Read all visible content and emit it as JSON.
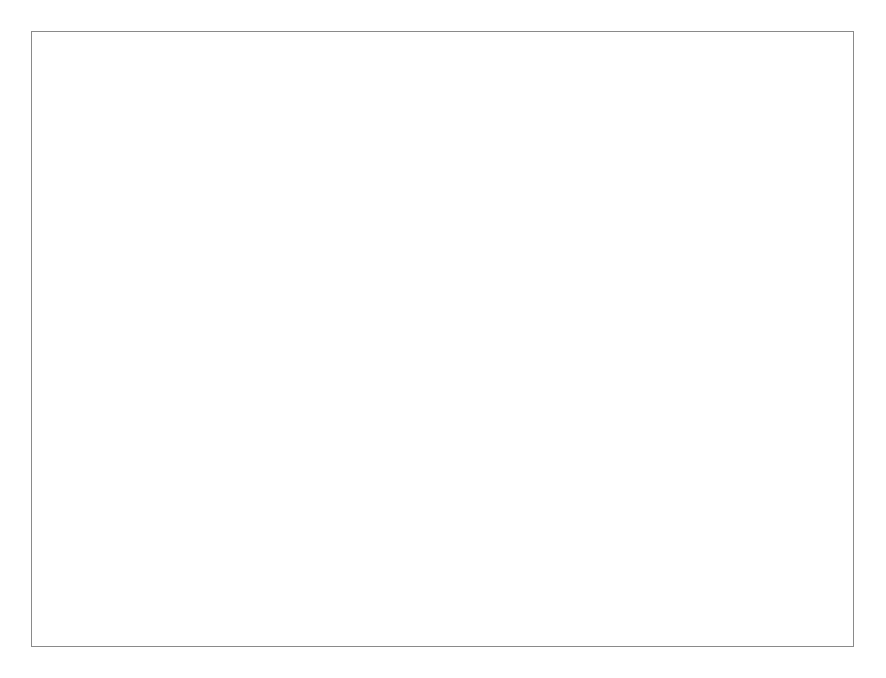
{
  "figure": {
    "caption": "Abb. 15  Verlauf der P-Zufuhr und des P-Entzuges bei Winterweizen, Rheinland-Pfalz und Saarland, im Zeitraum 1950 bis 1999"
  },
  "chart_data": {
    "type": "line",
    "title": "",
    "xlabel": "",
    "ylabel": "P-Zufuhr bzw. Entzug [kg/(ha•a) P]",
    "xlim": [
      1950,
      1999
    ],
    "ylim": [
      -10,
      50
    ],
    "yticks": [
      -10,
      0,
      10,
      20,
      30,
      40,
      50
    ],
    "ytick_labels": [
      "–10",
      "0",
      "10",
      "20",
      "30",
      "40",
      "50"
    ],
    "yminorticks": [
      -5,
      5,
      15,
      25,
      35,
      45
    ],
    "xticks": [
      1950,
      1960,
      1970,
      1980,
      1990,
      1999
    ],
    "xtick_labels": [
      "1950",
      "1960",
      "1970",
      "1980",
      "1990",
      "1999"
    ],
    "xminortick_step": 1,
    "grid": "horizontal",
    "gridlines": [
      0,
      10,
      20,
      30,
      40,
      50
    ],
    "legend_position": "top-left",
    "x": [
      1950,
      1951,
      1952,
      1953,
      1954,
      1955,
      1956,
      1957,
      1958,
      1959,
      1960,
      1961,
      1962,
      1963,
      1964,
      1965,
      1966,
      1967,
      1968,
      1969,
      1970,
      1971,
      1972,
      1973,
      1974,
      1975,
      1976,
      1977,
      1978,
      1979,
      1980,
      1981,
      1982,
      1983,
      1984,
      1985,
      1986,
      1987,
      1988,
      1989,
      1990,
      1991,
      1992,
      1993,
      1994,
      1995,
      1996,
      1997,
      1998,
      1999
    ],
    "series": [
      {
        "name": "P-Entzug",
        "style": "solid",
        "color": "#000000",
        "values": [
          12.5,
          12.5,
          12.4,
          12.4,
          12.3,
          12.3,
          12.4,
          12.6,
          12.3,
          12.1,
          12.0,
          11.7,
          11.6,
          11.8,
          12.4,
          11.8,
          13.2,
          11.9,
          12.5,
          12.9,
          13.2,
          13.4,
          13.6,
          13.4,
          12.9,
          14.9,
          14.3,
          15.3,
          15.6,
          14.0,
          13.9,
          11.0,
          14.5,
          14.0,
          13.7,
          13.6,
          13.4,
          14.3,
          14.2,
          16.0,
          17.2,
          17.4,
          17.0,
          15.3,
          15.3,
          15.3,
          16.2,
          16.8,
          17.3,
          17.8
        ]
      },
      {
        "name": "P-Zufuhr",
        "style": "dashed",
        "color": "#000000",
        "values": [
          11.0,
          12.8,
          13.6,
          15.0,
          16.6,
          18.3,
          20.0,
          21.6,
          23.2,
          24.8,
          25.9,
          25.3,
          26.0,
          28.0,
          31.0,
          37.0,
          34.6,
          33.6,
          36.0,
          39.4,
          41.0,
          42.1,
          42.0,
          43.8,
          44.4,
          42.5,
          41.5,
          44.0,
          41.9,
          42.8,
          41.7,
          43.2,
          44.6,
          42.4,
          40.2,
          39.7,
          40.0,
          40.3,
          41.4,
          41.5,
          43.5,
          9.6,
          8.5,
          8.6,
          9.2,
          11.3,
          15.2,
          16.6,
          18.1,
          19.0
        ]
      }
    ],
    "fill_series": {
      "name": "P-Überschuss",
      "color": "#b3b3b3",
      "definition": "P-Zufuhr minus P-Entzug",
      "values": [
        -1.5,
        0.3,
        1.2,
        2.6,
        4.3,
        6.0,
        7.6,
        9.0,
        10.9,
        12.7,
        13.9,
        13.6,
        14.4,
        16.2,
        18.6,
        25.2,
        21.4,
        21.7,
        23.5,
        26.5,
        27.8,
        28.7,
        28.4,
        30.4,
        31.5,
        27.6,
        27.2,
        28.7,
        26.3,
        28.8,
        27.8,
        32.2,
        30.1,
        28.4,
        26.5,
        26.1,
        26.6,
        26.0,
        27.2,
        25.5,
        26.3,
        -7.8,
        -9.5,
        -6.7,
        -6.1,
        -4.0,
        -1.0,
        -0.2,
        0.8,
        1.2
      ]
    },
    "legend": [
      {
        "label": "P-Entzug",
        "marker": "solid-line"
      },
      {
        "label": "P-Zufuhr",
        "marker": "dashed-line"
      },
      {
        "label": "P-Überschuss",
        "marker": "filled-swatch"
      }
    ]
  }
}
